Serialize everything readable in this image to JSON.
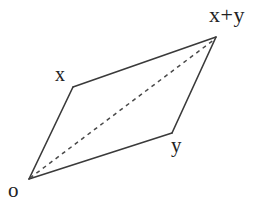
{
  "figure": {
    "background_color": "#ffffff",
    "stroke_color": "#3a3a3a",
    "dashed_stroke_color": "#4a4a4a",
    "labels": {
      "origin": "o",
      "x": "x",
      "y": "y",
      "sum": "x+y"
    },
    "vertices": {
      "origin": {
        "x": 29,
        "y": 179
      },
      "x": {
        "x": 73,
        "y": 87
      },
      "y": {
        "x": 172,
        "y": 133
      },
      "sum": {
        "x": 216,
        "y": 37
      }
    },
    "edges": [
      {
        "name": "origin-to-x",
        "from": "origin",
        "to": "x",
        "style": "solid"
      },
      {
        "name": "x-to-sum",
        "from": "x",
        "to": "sum",
        "style": "solid"
      },
      {
        "name": "sum-to-y",
        "from": "sum",
        "to": "y",
        "style": "solid"
      },
      {
        "name": "y-to-origin",
        "from": "y",
        "to": "origin",
        "style": "solid"
      }
    ],
    "diagonal": {
      "name": "origin-to-sum-diagonal",
      "from": "origin",
      "to": "sum",
      "style": "dashed",
      "dash_pattern": "4 4"
    }
  }
}
